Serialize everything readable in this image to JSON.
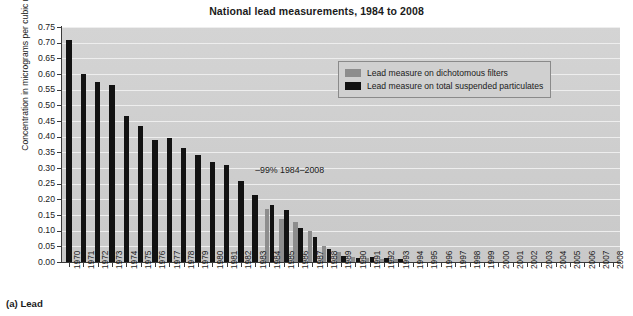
{
  "chart_data": {
    "type": "bar",
    "title": "National lead measurements, 1984 to 2008",
    "xlabel": "",
    "ylabel": "Concentration in micrograms per cubic metre",
    "ylim": [
      0.0,
      0.75
    ],
    "ytick_labels": [
      "0.75",
      "0.70",
      "0.65",
      "0.60",
      "0.55",
      "0.50",
      "0.45",
      "0.40",
      "0.35",
      "0.30",
      "0.25",
      "0.20",
      "0.15",
      "0.10",
      "0.05",
      "0.00"
    ],
    "ytick_values": [
      0.75,
      0.7,
      0.65,
      0.6,
      0.55,
      0.5,
      0.45,
      0.4,
      0.35,
      0.3,
      0.25,
      0.2,
      0.15,
      0.1,
      0.05,
      0.0
    ],
    "grid": true,
    "legend_position": "upper right",
    "categories": [
      "1970",
      "1971",
      "1972",
      "1973",
      "1974",
      "1975",
      "1976",
      "1977",
      "1978",
      "1979",
      "1980",
      "1981",
      "1982",
      "1983",
      "1984",
      "1985",
      "1986",
      "1987",
      "1988",
      "1989",
      "1990",
      "1991",
      "1992",
      "1993",
      "1994",
      "1995",
      "1996",
      "1997",
      "1998",
      "1999",
      "2000",
      "2001",
      "2002",
      "2003",
      "2004",
      "2005",
      "2006",
      "2007",
      "2008"
    ],
    "series": [
      {
        "name": "Lead measure on dichotomous filters",
        "color": "#8d8d8d",
        "values": [
          null,
          null,
          null,
          null,
          null,
          null,
          null,
          null,
          null,
          null,
          null,
          null,
          null,
          null,
          0.168,
          0.137,
          0.128,
          0.099,
          0.052,
          0.033,
          0.016,
          0.012,
          0.01,
          0.009,
          null,
          null,
          null,
          null,
          null,
          null,
          null,
          null,
          null,
          null,
          null,
          null,
          null,
          null,
          null
        ]
      },
      {
        "name": "Lead measure on total suspended particulates",
        "color": "#121212",
        "values": [
          0.71,
          0.6,
          0.575,
          0.565,
          0.465,
          0.435,
          0.39,
          0.395,
          0.365,
          0.34,
          0.32,
          0.31,
          0.26,
          0.215,
          0.183,
          0.166,
          0.108,
          0.08,
          0.042,
          0.018,
          0.012,
          0.016,
          0.014,
          0.01,
          null,
          null,
          null,
          null,
          null,
          null,
          null,
          null,
          null,
          null,
          null,
          null,
          null,
          null,
          null
        ]
      }
    ],
    "annotations": [
      {
        "text": "–99% 1984–2008",
        "x_category": "1983",
        "y_value": 0.29
      }
    ]
  },
  "legend": {
    "items": [
      {
        "label": "Lead measure on dichotomous filters",
        "swatch": "dich"
      },
      {
        "label": "Lead measure on total suspended particulates",
        "swatch": "tsp"
      }
    ]
  },
  "figure": {
    "caption": "(a) Lead"
  }
}
